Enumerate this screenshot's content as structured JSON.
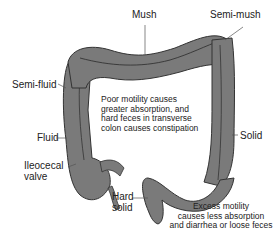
{
  "diagram": {
    "colors": {
      "colon_fill": "#7a7a7a",
      "colon_outline": "#333333",
      "text": "#222222",
      "background": "#ffffff"
    },
    "labels": {
      "mush": "Mush",
      "semi_mush": "Semi-mush",
      "semi_fluid": "Semi-fluid",
      "fluid": "Fluid",
      "ileocecal_line1": "Ileocecal",
      "ileocecal_line2": "valve",
      "solid": "Solid",
      "hard_solid_line1": "Hard",
      "hard_solid_line2": "solid"
    },
    "notes": {
      "poor_motility": [
        "Poor motility causes",
        "greater absorption, and",
        "hard feces in transverse",
        "colon causes constipation"
      ],
      "excess_motility": [
        "Excess motility",
        "causes less absorption",
        "and diarrhea or loose feces"
      ]
    }
  }
}
